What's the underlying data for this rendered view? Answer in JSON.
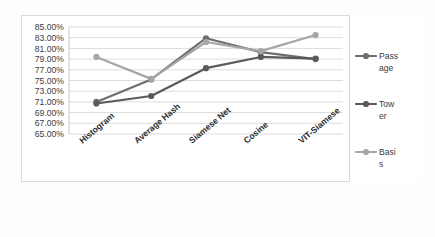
{
  "chart_data": {
    "type": "line",
    "title": "",
    "xlabel": "",
    "ylabel": "",
    "categories": [
      "Histogram",
      "Average Hash",
      "Siamese Net",
      "Cosine",
      "VIT-Siamese"
    ],
    "ylim": [
      65,
      85
    ],
    "ytick_step": 2,
    "ytick_labels": [
      "85.00%",
      "83.00%",
      "81.00%",
      "79.00%",
      "77.00%",
      "75.00%",
      "73.00%",
      "71.00%",
      "69.00%",
      "67.00%",
      "65.00%"
    ],
    "ytick_values": [
      85,
      83,
      81,
      79,
      77,
      75,
      73,
      71,
      69,
      67,
      65
    ],
    "grid": true,
    "legend_position": "right",
    "series": [
      {
        "name": "Passage",
        "color": "#6e6e6e",
        "values": [
          71.0,
          75.2,
          82.9,
          80.3,
          79.0
        ]
      },
      {
        "name": "Tower",
        "color": "#5a5a5a",
        "values": [
          70.7,
          72.1,
          77.3,
          79.4,
          79.1
        ]
      },
      {
        "name": "Basis",
        "color": "#a6a6a6",
        "values": [
          79.4,
          75.3,
          82.2,
          80.5,
          83.5
        ]
      }
    ]
  },
  "legend": {
    "items": [
      {
        "label_line1": "Pass",
        "label_line2": "age",
        "full": "Passage"
      },
      {
        "label_line1": "Tow",
        "label_line2": "er",
        "full": "Tower"
      },
      {
        "label_line1": "Basi",
        "label_line2": "s",
        "full": "Basis"
      }
    ]
  },
  "colors": {
    "series_passage": "#6e6e6e",
    "series_tower": "#5a5a5a",
    "series_basis": "#a6a6a6",
    "gridline": "#dcdcdc",
    "plot_border": "#d9d9d9",
    "background": "#ffffff",
    "text": "#3b3b3b"
  }
}
